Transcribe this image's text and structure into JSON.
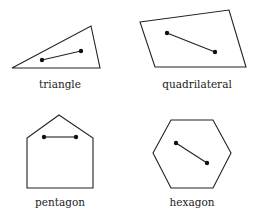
{
  "figure": {
    "panels": [
      {
        "label": "triangle",
        "polygon": [
          [
            12,
            68
          ],
          [
            91,
            26
          ],
          [
            100,
            68
          ]
        ],
        "segment": [
          [
            42,
            60
          ],
          [
            81,
            51
          ]
        ],
        "label_pos": [
          60,
          88
        ]
      },
      {
        "label": "quadrilateral",
        "polygon": [
          [
            140,
            22
          ],
          [
            229,
            10
          ],
          [
            246,
            67
          ],
          [
            155,
            67
          ]
        ],
        "segment": [
          [
            167,
            33
          ],
          [
            215,
            52
          ]
        ],
        "label_pos": [
          197,
          88
        ]
      },
      {
        "label": "pentagon",
        "polygon": [
          [
            59,
            115
          ],
          [
            93,
            138
          ],
          [
            93,
            188
          ],
          [
            27,
            188
          ],
          [
            27,
            138
          ]
        ],
        "segment": [
          [
            44,
            137
          ],
          [
            76,
            137
          ]
        ],
        "label_pos": [
          60,
          206
        ]
      },
      {
        "label": "hexagon",
        "polygon": [
          [
            171,
            120
          ],
          [
            213,
            120
          ],
          [
            231,
            153
          ],
          [
            213,
            188
          ],
          [
            171,
            188
          ],
          [
            153,
            153
          ]
        ],
        "segment": [
          [
            176,
            143
          ],
          [
            207,
            163
          ]
        ],
        "label_pos": [
          192,
          206
        ]
      }
    ],
    "colors": {
      "stroke": "#222222",
      "background": "#ffffff"
    }
  }
}
